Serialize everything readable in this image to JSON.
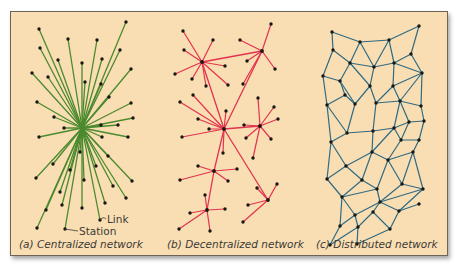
{
  "figure": {
    "background_color": "#f9deb3",
    "panels": [
      {
        "id": "centralized",
        "caption": "(a) Centralized network",
        "line_color": "#4b8a2f",
        "hub": [
          82,
          128
        ],
        "nodes": [
          [
            39,
            29
          ],
          [
            68,
            39
          ],
          [
            97,
            40
          ],
          [
            126,
            22
          ],
          [
            40,
            48
          ],
          [
            58,
            60
          ],
          [
            82,
            63
          ],
          [
            102,
            59
          ],
          [
            120,
            50
          ],
          [
            32,
            73
          ],
          [
            48,
            77
          ],
          [
            85,
            82
          ],
          [
            101,
            84
          ],
          [
            131,
            69
          ],
          [
            37,
            102
          ],
          [
            109,
            97
          ],
          [
            131,
            103
          ],
          [
            54,
            117
          ],
          [
            133,
            118
          ],
          [
            64,
            128
          ],
          [
            101,
            125
          ],
          [
            118,
            125
          ],
          [
            39,
            137
          ],
          [
            102,
            137
          ],
          [
            128,
            137
          ],
          [
            80,
            152
          ],
          [
            53,
            164
          ],
          [
            70,
            170
          ],
          [
            96,
            166
          ],
          [
            108,
            156
          ],
          [
            36,
            178
          ],
          [
            84,
            180
          ],
          [
            113,
            186
          ],
          [
            132,
            181
          ],
          [
            60,
            192
          ],
          [
            126,
            198
          ],
          [
            62,
            205
          ],
          [
            105,
            203
          ],
          [
            82,
            208
          ],
          [
            46,
            210
          ],
          [
            100,
            220
          ],
          [
            37,
            228
          ],
          [
            65,
            229
          ]
        ],
        "annotations": [
          {
            "label": "Link",
            "x": 107,
            "y": 213
          },
          {
            "label": "Station",
            "x": 79,
            "y": 226
          }
        ]
      },
      {
        "id": "decentralized",
        "caption": "(b) Decentralized network",
        "line_color": "#e2334f",
        "hubs": [
          {
            "at": [
              202,
              62
            ],
            "leaves": [
              [
                183,
                31
              ],
              [
                213,
                40
              ],
              [
                184,
                50
              ],
              [
                225,
                66
              ],
              [
                175,
                74
              ],
              [
                192,
                79
              ],
              [
                206,
                86
              ],
              [
                228,
                85
              ]
            ]
          },
          {
            "at": [
              262,
              51
            ],
            "leaves": [
              [
                271,
                24
              ],
              [
                240,
                40
              ],
              [
                247,
                61
              ],
              [
                275,
                69
              ],
              [
                243,
                84
              ]
            ]
          },
          {
            "at": [
              224,
              129
            ],
            "leaves": [
              [
                193,
                95
              ],
              [
                180,
                102
              ],
              [
                226,
                111
              ],
              [
                198,
                119
              ],
              [
                209,
                129
              ],
              [
                182,
                137
              ],
              [
                223,
                153
              ]
            ]
          },
          {
            "at": [
              260,
              126
            ],
            "leaves": [
              [
                258,
                98
              ],
              [
                274,
                107
              ],
              [
                278,
                119
              ],
              [
                244,
                125
              ],
              [
                246,
                138
              ],
              [
                271,
                139
              ],
              [
                253,
                158
              ]
            ]
          },
          {
            "at": [
              214,
              171
            ],
            "leaves": [
              [
                198,
                166
              ],
              [
                237,
                169
              ],
              [
                180,
                180
              ],
              [
                228,
                181
              ]
            ]
          },
          {
            "at": [
              268,
              200
            ],
            "leaves": [
              [
                257,
                188
              ],
              [
                277,
                184
              ],
              [
                248,
                205
              ],
              [
                243,
                222
              ]
            ]
          },
          {
            "at": [
              207,
              210
            ],
            "leaves": [
              [
                205,
                195
              ],
              [
                190,
                213
              ],
              [
                225,
                209
              ],
              [
                179,
                229
              ],
              [
                210,
                231
              ]
            ]
          }
        ],
        "hub_links": [
          [
            0,
            1
          ],
          [
            0,
            2
          ],
          [
            1,
            2
          ],
          [
            2,
            3
          ],
          [
            2,
            4
          ],
          [
            2,
            5
          ],
          [
            4,
            6
          ]
        ]
      },
      {
        "id": "distributed",
        "caption": "(c) Distributed network",
        "line_color": "#2f6b84",
        "nodes": [
          [
            332,
            32
          ],
          [
            360,
            42
          ],
          [
            389,
            40
          ],
          [
            419,
            26
          ],
          [
            333,
            50
          ],
          [
            350,
            63
          ],
          [
            374,
            67
          ],
          [
            394,
            63
          ],
          [
            411,
            54
          ],
          [
            323,
            76
          ],
          [
            340,
            81
          ],
          [
            370,
            86
          ],
          [
            355,
            104
          ],
          [
            376,
            103
          ],
          [
            393,
            86
          ],
          [
            422,
            73
          ],
          [
            327,
            105
          ],
          [
            345,
            95
          ],
          [
            400,
            101
          ],
          [
            421,
            106
          ],
          [
            347,
            133
          ],
          [
            373,
            131
          ],
          [
            394,
            128
          ],
          [
            409,
            122
          ],
          [
            424,
            121
          ],
          [
            331,
            142
          ],
          [
            372,
            152
          ],
          [
            401,
            140
          ],
          [
            419,
            140
          ],
          [
            346,
            166
          ],
          [
            362,
            180
          ],
          [
            388,
            160
          ],
          [
            413,
            152
          ],
          [
            327,
            179
          ],
          [
            377,
            189
          ],
          [
            402,
            184
          ],
          [
            423,
            189
          ],
          [
            342,
            197
          ],
          [
            380,
            202
          ],
          [
            355,
            215
          ],
          [
            373,
            212
          ],
          [
            399,
            211
          ],
          [
            419,
            204
          ],
          [
            340,
            226
          ],
          [
            358,
            227
          ],
          [
            390,
            229
          ],
          [
            330,
            245
          ],
          [
            357,
            244
          ]
        ],
        "edges": [
          [
            0,
            1
          ],
          [
            1,
            2
          ],
          [
            2,
            3
          ],
          [
            0,
            4
          ],
          [
            1,
            5
          ],
          [
            1,
            6
          ],
          [
            2,
            6
          ],
          [
            2,
            7
          ],
          [
            3,
            8
          ],
          [
            4,
            5
          ],
          [
            5,
            6
          ],
          [
            6,
            7
          ],
          [
            7,
            8
          ],
          [
            8,
            15
          ],
          [
            4,
            9
          ],
          [
            5,
            10
          ],
          [
            5,
            11
          ],
          [
            6,
            11
          ],
          [
            7,
            14
          ],
          [
            9,
            10
          ],
          [
            10,
            12
          ],
          [
            10,
            17
          ],
          [
            11,
            13
          ],
          [
            11,
            12
          ],
          [
            13,
            14
          ],
          [
            14,
            15
          ],
          [
            7,
            15
          ],
          [
            14,
            18
          ],
          [
            15,
            18
          ],
          [
            15,
            19
          ],
          [
            9,
            16
          ],
          [
            16,
            17
          ],
          [
            17,
            12
          ],
          [
            12,
            20
          ],
          [
            13,
            21
          ],
          [
            13,
            18
          ],
          [
            18,
            19
          ],
          [
            18,
            22
          ],
          [
            18,
            23
          ],
          [
            19,
            24
          ],
          [
            16,
            20
          ],
          [
            16,
            25
          ],
          [
            20,
            21
          ],
          [
            21,
            22
          ],
          [
            22,
            23
          ],
          [
            23,
            24
          ],
          [
            20,
            25
          ],
          [
            21,
            26
          ],
          [
            22,
            26
          ],
          [
            22,
            27
          ],
          [
            23,
            27
          ],
          [
            24,
            28
          ],
          [
            27,
            28
          ],
          [
            25,
            29
          ],
          [
            26,
            29
          ],
          [
            26,
            30
          ],
          [
            26,
            31
          ],
          [
            27,
            31
          ],
          [
            28,
            32
          ],
          [
            31,
            32
          ],
          [
            25,
            33
          ],
          [
            29,
            33
          ],
          [
            29,
            30
          ],
          [
            30,
            34
          ],
          [
            31,
            34
          ],
          [
            31,
            35
          ],
          [
            32,
            35
          ],
          [
            32,
            36
          ],
          [
            30,
            37
          ],
          [
            33,
            37
          ],
          [
            34,
            37
          ],
          [
            34,
            38
          ],
          [
            35,
            38
          ],
          [
            35,
            36
          ],
          [
            36,
            38
          ],
          [
            37,
            39
          ],
          [
            38,
            39
          ],
          [
            38,
            40
          ],
          [
            38,
            41
          ],
          [
            36,
            41
          ],
          [
            41,
            42
          ],
          [
            37,
            43
          ],
          [
            39,
            43
          ],
          [
            39,
            44
          ],
          [
            40,
            44
          ],
          [
            40,
            45
          ],
          [
            41,
            45
          ],
          [
            43,
            46
          ],
          [
            44,
            46
          ],
          [
            44,
            47
          ],
          [
            45,
            47
          ]
        ]
      }
    ]
  }
}
